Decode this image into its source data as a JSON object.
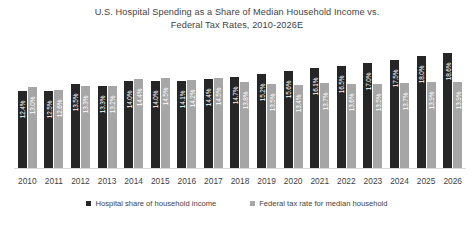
{
  "chart_data": {
    "type": "bar",
    "title": "U.S. Hospital Spending as a Share of Median Household Income vs. Federal Tax Rates, 2010-2026E",
    "title_lines": [
      "U.S. Hospital Spending as a Share of Median Household Income vs.",
      "Federal Tax Rates, 2010-2026E"
    ],
    "xlabel": "",
    "ylabel": "",
    "ylim": [
      0,
      20
    ],
    "grid": false,
    "legend_position": "bottom",
    "categories": [
      "2010",
      "2011",
      "2012",
      "2013",
      "2014",
      "2015",
      "2016",
      "2017",
      "2018",
      "2019",
      "2020",
      "2021",
      "2022",
      "2023",
      "2024",
      "2025",
      "2026"
    ],
    "series": [
      {
        "name": "Hospital share of household income",
        "color": "#262626",
        "values": [
          12.4,
          12.5,
          13.5,
          13.3,
          14.0,
          14.0,
          14.1,
          14.4,
          14.7,
          15.2,
          15.6,
          16.1,
          16.5,
          17.0,
          17.5,
          18.0,
          18.6
        ],
        "labels": [
          "12.4%",
          "12.5%",
          "13.5%",
          "13.3%",
          "14.0%",
          "14.0%",
          "14.1%",
          "14.4%",
          "14.7%",
          "15.2%",
          "15.6%",
          "16.1%",
          "16.5%",
          "17.0%",
          "17.5%",
          "18.0%",
          "18.6%"
        ]
      },
      {
        "name": "Federal tax rate for median household",
        "color": "#a6a6a6",
        "values": [
          13.0,
          12.6,
          13.3,
          13.2,
          14.4,
          14.5,
          14.2,
          14.5,
          13.8,
          13.5,
          13.4,
          13.7,
          13.6,
          13.5,
          13.7,
          13.9,
          13.9
        ],
        "labels": [
          "13.0%",
          "12.6%",
          "13.3%",
          "13.2%",
          "14.4%",
          "14.5%",
          "14.2%",
          "14.5%",
          "13.8%",
          "13.5%",
          "13.4%",
          "13.7%",
          "13.6%",
          "13.5%",
          "13.7%",
          "13.9%",
          "13.9%"
        ]
      }
    ],
    "legend": [
      {
        "label": "Hospital share of household income",
        "color": "#262626"
      },
      {
        "label": "Federal tax rate for median household",
        "color": "#a6a6a6"
      }
    ]
  }
}
